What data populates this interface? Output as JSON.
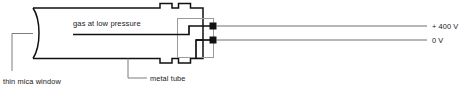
{
  "diagram": {
    "labels": {
      "gas": "gas at low pressure",
      "mica_window": "thin mica window",
      "metal_tube": "metal tube",
      "voltage_high": "+ 400 V",
      "voltage_ground": "0 V"
    },
    "colors": {
      "outline": "#111111",
      "inner_box": "#9a9a9a",
      "lead_wire": "#6f6f6f",
      "leader": "#7d7d7d",
      "text": "#1a1a1a",
      "background": "#ffffff"
    },
    "terminals": [
      {
        "name": "high-voltage-terminal",
        "voltage": "+ 400 V"
      },
      {
        "name": "ground-terminal",
        "voltage": "0 V"
      }
    ]
  }
}
